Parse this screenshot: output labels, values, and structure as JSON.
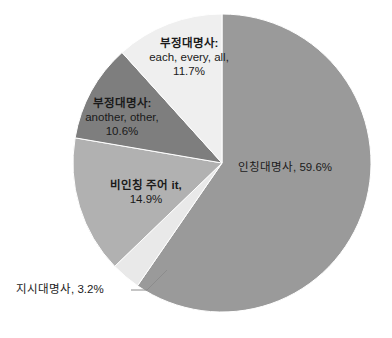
{
  "chart_data": {
    "type": "pie",
    "title": "",
    "categories": [
      "인칭대명사",
      "지시대명사",
      "비인칭 주어 it",
      "부정대명사: another, other",
      "부정대명사: each, every, all"
    ],
    "values": [
      59.6,
      3.2,
      14.9,
      10.6,
      11.7
    ],
    "value_unit": "%",
    "start_angle_deg": 0,
    "direction": "clockwise",
    "legend": "none",
    "grid": false,
    "labels_position": "inside-and-callout",
    "colors": [
      "#9a9a9a",
      "#e9e9e9",
      "#b1b1b1",
      "#7e7e7e",
      "#efefef"
    ],
    "slices": [
      {
        "name": "인칭대명사",
        "value": 59.6,
        "label_name": "인칭대명사,",
        "label_sub": "",
        "label_pct": "59.6%",
        "label_inline": "인칭대명사, 59.6%",
        "color": "#9a9a9a",
        "callout": false
      },
      {
        "name": "지시대명사",
        "value": 3.2,
        "label_name": "지시대명사,",
        "label_sub": "",
        "label_pct": "3.2%",
        "label_inline": "지시대명사, 3.2%",
        "color": "#e9e9e9",
        "callout": true
      },
      {
        "name": "비인칭 주어 it",
        "value": 14.9,
        "label_name": "비인칭 주어 it,",
        "label_sub": "",
        "label_pct": "14.9%",
        "label_inline": "비인칭 주어 it, 14.9%",
        "color": "#b1b1b1",
        "callout": false
      },
      {
        "name": "부정대명사: another, other",
        "value": 10.6,
        "label_name": "부정대명사:",
        "label_sub": "another, other,",
        "label_pct": "10.6%",
        "label_inline": "부정대명사: another, other, 10.6%",
        "color": "#7e7e7e",
        "callout": false
      },
      {
        "name": "부정대명사: each, every, all",
        "value": 11.7,
        "label_name": "부정대명사:",
        "label_sub": "each, every, all,",
        "label_pct": "11.7%",
        "label_inline": "부정대명사: each, every, all, 11.7%",
        "color": "#efefef",
        "callout": true
      }
    ]
  },
  "geometry": {
    "center_x": 222,
    "center_y": 163,
    "radius": 149
  }
}
